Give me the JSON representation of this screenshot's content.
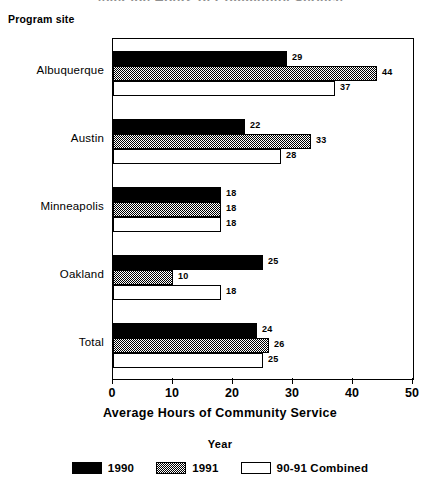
{
  "clipped_title": "Average Hours of Community Service",
  "axis_caption": "Program site",
  "xaxis_title": "Average Hours of Community Service",
  "legend": {
    "title": "Year",
    "items": [
      {
        "label": "1990",
        "swatch": "black-solid-swatch"
      },
      {
        "label": "1991",
        "swatch": "hatched-gray-swatch"
      },
      {
        "label": "90-91 Combined",
        "swatch": "white-outline-swatch"
      }
    ]
  },
  "chart_data": {
    "type": "bar",
    "orientation": "horizontal",
    "title": "Average Hours of Community Service",
    "xlabel": "Average Hours of Community Service",
    "ylabel": "Program site",
    "xlim": [
      0,
      50
    ],
    "xticks": [
      0,
      10,
      20,
      30,
      40,
      50
    ],
    "xtick_labels": [
      "0",
      "10",
      "20",
      "30",
      "40",
      "50"
    ],
    "grid": false,
    "legend_position": "bottom-center",
    "legend_title": "Year",
    "categories": [
      "Albuquerque",
      "Austin",
      "Minneapolis",
      "Oakland",
      "Total"
    ],
    "series": [
      {
        "name": "1990",
        "color": "#000000",
        "fill": "solid",
        "values": [
          29,
          22,
          18,
          25,
          24
        ]
      },
      {
        "name": "1991",
        "color": "#808080",
        "fill": "hatched",
        "values": [
          44,
          33,
          18,
          10,
          26
        ]
      },
      {
        "name": "90-91 Combined",
        "color": "#ffffff",
        "fill": "empty",
        "values": [
          37,
          28,
          18,
          18,
          25
        ]
      }
    ]
  }
}
